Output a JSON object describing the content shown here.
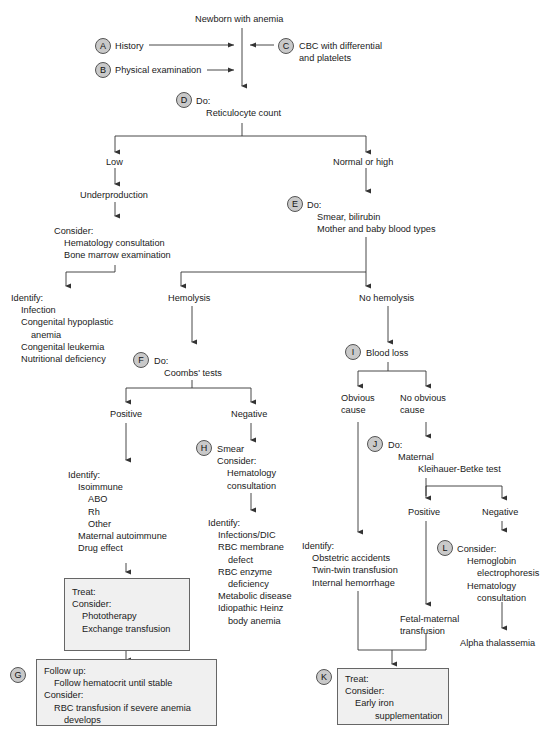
{
  "diagram": {
    "title": "Newborn with anemia",
    "inputs": {
      "A": {
        "badge": "A",
        "label": "History"
      },
      "B": {
        "badge": "B",
        "label": "Physical examination"
      },
      "C": {
        "badge": "C",
        "label_line1": "CBC with differential",
        "label_line2": "and platelets"
      }
    },
    "step_D": {
      "badge": "D",
      "heading": "Do:",
      "item": "Reticulocyte count"
    },
    "low_branch": {
      "label": "Low",
      "result": "Underproduction",
      "consider": {
        "heading": "Consider:",
        "items": [
          "Hematology consultation",
          "Bone marrow examination"
        ]
      },
      "identify": {
        "heading": "Identify:",
        "items": [
          "Infection",
          "Congenital hypoplastic",
          "anemia",
          "Congenital leukemia",
          "Nutritional deficiency"
        ]
      }
    },
    "high_branch": {
      "label": "Normal or high",
      "step_E": {
        "badge": "E",
        "heading": "Do:",
        "items": [
          "Smear, bilirubin",
          "Mother and baby blood types"
        ]
      }
    },
    "hemolysis": {
      "label": "Hemolysis",
      "step_F": {
        "badge": "F",
        "heading": "Do:",
        "item": "Coombs' tests"
      },
      "positive": {
        "label": "Positive",
        "identify": {
          "heading": "Identify:",
          "items": [
            "Isoimmune",
            "ABO",
            "Rh",
            "Other",
            "Maternal autoimmune",
            "Drug effect"
          ]
        },
        "treat_box": {
          "heading": "Treat:",
          "subheading": "Consider:",
          "items": [
            "Phototherapy",
            "Exchange transfusion"
          ]
        }
      },
      "negative": {
        "label": "Negative",
        "step_H": {
          "badge": "H",
          "line1": "Smear",
          "line2": "Consider:",
          "items": [
            "Hematology",
            "consultation"
          ]
        },
        "identify": {
          "heading": "Identify:",
          "items": [
            "Infections/DIC",
            "RBC membrane",
            "defect",
            "RBC enzyme",
            "deficiency",
            "Metabolic disease",
            "Idiopathic Heinz",
            "body anemia"
          ]
        }
      },
      "follow_up_G": {
        "badge": "G",
        "heading": "Follow up:",
        "item1": "Follow hematocrit until stable",
        "subheading": "Consider:",
        "item2": "RBC transfusion if severe anemia",
        "item2_cont": "develops"
      }
    },
    "no_hemolysis": {
      "label": "No hemolysis",
      "step_I": {
        "badge": "I",
        "label": "Blood loss"
      },
      "obvious": {
        "line1": "Obvious",
        "line2": "cause",
        "identify": {
          "heading": "Identify:",
          "items": [
            "Obstetric accidents",
            "Twin-twin transfusion",
            "Internal hemorrhage"
          ]
        }
      },
      "not_obvious": {
        "line1": "No obvious",
        "line2": "cause",
        "step_J": {
          "badge": "J",
          "heading": "Do:",
          "item1": "Maternal",
          "item2": "Kleihauer-Betke test"
        },
        "positive": {
          "label": "Positive",
          "result_line1": "Fetal-maternal",
          "result_line2": "transfusion"
        },
        "negative": {
          "label": "Negative",
          "step_L": {
            "badge": "L",
            "heading": "Consider:",
            "items": [
              "Hemoglobin",
              "electrophoresis",
              "Hematology",
              "consultation"
            ]
          },
          "result": "Alpha thalassemia"
        }
      },
      "treat_K": {
        "badge": "K",
        "heading": "Treat:",
        "subheading": "Consider:",
        "item1": "Early iron",
        "item2": "supplementation"
      }
    }
  },
  "colors": {
    "line": "#333333",
    "badge_fill": "#c9c9c9",
    "box_fill": "#f0f0f0"
  }
}
